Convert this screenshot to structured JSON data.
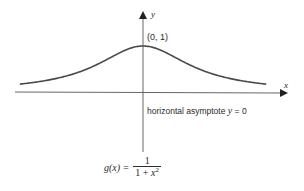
{
  "chart_data": {
    "type": "line",
    "title": "",
    "function": "g(x) = 1 / (1 + x^2)",
    "xlabel": "x",
    "ylabel": "y",
    "x": [
      -2.2,
      -2,
      -1.5,
      -1,
      -0.5,
      0,
      0.5,
      1,
      1.5,
      2,
      2.2
    ],
    "series": [
      {
        "name": "g(x)",
        "values": [
          0.171,
          0.2,
          0.308,
          0.5,
          0.8,
          1.0,
          0.8,
          0.5,
          0.308,
          0.2,
          0.171
        ]
      }
    ],
    "annotations": [
      {
        "text": "(0, 1)",
        "x": 0,
        "y": 1
      },
      {
        "text": "horizontal asymptote y = 0",
        "x": 0,
        "y": 0
      }
    ],
    "grid": false,
    "legend": null
  },
  "labels": {
    "y_axis": "y",
    "x_axis": "x",
    "point": "(0, 1)",
    "asymptote_prefix": "horizontal asymptote ",
    "asymptote_var": "y",
    "asymptote_eq": " = 0",
    "formula_lhs": "g(x) = ",
    "formula_num": "1",
    "formula_den_prefix": "1 + ",
    "formula_den_var": "x",
    "formula_den_exp": "2"
  },
  "colors": {
    "curve": "#4a4a4a",
    "axis": "#555555",
    "text": "#2b2b2b"
  }
}
